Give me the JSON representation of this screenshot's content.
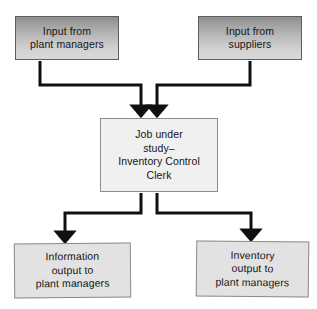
{
  "diagram": {
    "type": "flowchart",
    "background_color": "#ffffff",
    "connector_color": "#101010",
    "nodes": [
      {
        "id": "input-plant-managers",
        "role": "input",
        "lines": [
          "Input from",
          "plant managers"
        ],
        "fill": "gradient-gray",
        "border_color": "#5d5d5d"
      },
      {
        "id": "input-suppliers",
        "role": "input",
        "lines": [
          "Input from",
          "suppliers"
        ],
        "fill": "gradient-gray",
        "border_color": "#5d5d5d"
      },
      {
        "id": "job-under-study",
        "role": "process",
        "lines": [
          "Job under",
          "study–",
          "Inventory Control",
          "Clerk"
        ],
        "fill": "#f0f0f0",
        "border_color": "#8c8c8c"
      },
      {
        "id": "information-output",
        "role": "output",
        "lines": [
          "Information",
          "output to",
          "plant managers"
        ],
        "fill": "#e2e2e2",
        "border_color": "#8c8c8c"
      },
      {
        "id": "inventory-output",
        "role": "output",
        "lines": [
          "Inventory",
          "output to",
          "plant managers"
        ],
        "fill": "#e2e2e2",
        "border_color": "#8c8c8c"
      }
    ],
    "edges": [
      {
        "id": "edge-plant-managers-to-job",
        "from": "input-plant-managers",
        "to": "job-under-study",
        "style": "elbow-arrow"
      },
      {
        "id": "edge-suppliers-to-job",
        "from": "input-suppliers",
        "to": "job-under-study",
        "style": "elbow-arrow"
      },
      {
        "id": "edge-job-to-information",
        "from": "job-under-study",
        "to": "information-output",
        "style": "elbow-arrow"
      },
      {
        "id": "edge-job-to-inventory",
        "from": "job-under-study",
        "to": "inventory-output",
        "style": "elbow-arrow"
      }
    ]
  }
}
